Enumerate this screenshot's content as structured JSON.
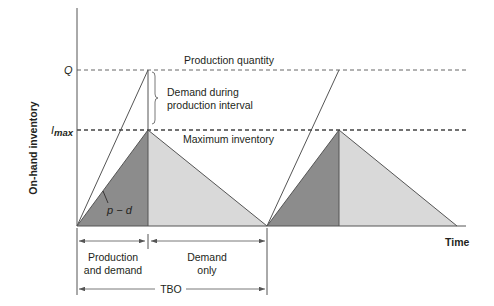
{
  "diagram": {
    "type": "production-inventory-cycle",
    "axes": {
      "y_label": "On-hand inventory",
      "x_label": "Time",
      "y_ticks": {
        "q": "Q",
        "imax_base": "I",
        "imax_sub": "max"
      }
    },
    "annotations": {
      "production_quantity": "Production quantity",
      "demand_during_line1": "Demand during",
      "demand_during_line2": "production interval",
      "maximum_inventory": "Maximum inventory",
      "slope_label": "p − d"
    },
    "intervals": {
      "production_and_demand_line1": "Production",
      "production_and_demand_line2": "and demand",
      "demand_only_line1": "Demand",
      "demand_only_line2": "only",
      "tbo": "TBO"
    },
    "colors": {
      "production_phase_fill": "#8c8c8c",
      "demand_phase_fill": "#d9d9d9",
      "line": "#555555",
      "dashed": "#666666"
    },
    "cycles": 2
  }
}
